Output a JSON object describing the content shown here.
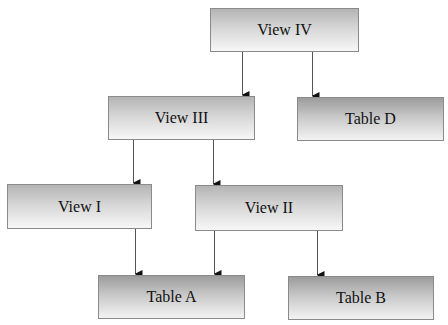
{
  "diagram": {
    "nodes": [
      {
        "id": "view4",
        "label": "View IV",
        "kind": "view",
        "x": 210,
        "y": 8,
        "w": 149,
        "h": 44
      },
      {
        "id": "view3",
        "label": "View III",
        "kind": "view",
        "x": 108,
        "y": 96,
        "w": 147,
        "h": 44
      },
      {
        "id": "tableD",
        "label": "Table D",
        "kind": "table",
        "x": 297,
        "y": 97,
        "w": 147,
        "h": 44
      },
      {
        "id": "view1",
        "label": "View I",
        "kind": "view",
        "x": 7,
        "y": 184,
        "w": 145,
        "h": 45
      },
      {
        "id": "view2",
        "label": "View II",
        "kind": "view",
        "x": 195,
        "y": 185,
        "w": 148,
        "h": 46
      },
      {
        "id": "tableA",
        "label": "Table A",
        "kind": "table",
        "x": 98,
        "y": 275,
        "w": 147,
        "h": 44
      },
      {
        "id": "tableB",
        "label": "Table B",
        "kind": "table",
        "x": 288,
        "y": 276,
        "w": 146,
        "h": 44
      }
    ],
    "edges": [
      {
        "from": "view4",
        "to": "view3",
        "x": 242,
        "y1": 52,
        "y2": 96
      },
      {
        "from": "view4",
        "to": "tableD",
        "x": 312,
        "y1": 52,
        "y2": 97
      },
      {
        "from": "view3",
        "to": "view1",
        "x": 133,
        "y1": 140,
        "y2": 184
      },
      {
        "from": "view3",
        "to": "view2",
        "x": 213,
        "y1": 140,
        "y2": 185
      },
      {
        "from": "view1",
        "to": "tableA",
        "x": 135,
        "y1": 229,
        "y2": 275
      },
      {
        "from": "view2",
        "to": "tableA",
        "x": 214,
        "y1": 231,
        "y2": 275
      },
      {
        "from": "view2",
        "to": "tableB",
        "x": 317,
        "y1": 231,
        "y2": 276
      }
    ]
  },
  "colors": {
    "edge": "#555555",
    "border": "#8a8a8a",
    "text": "#111111"
  }
}
